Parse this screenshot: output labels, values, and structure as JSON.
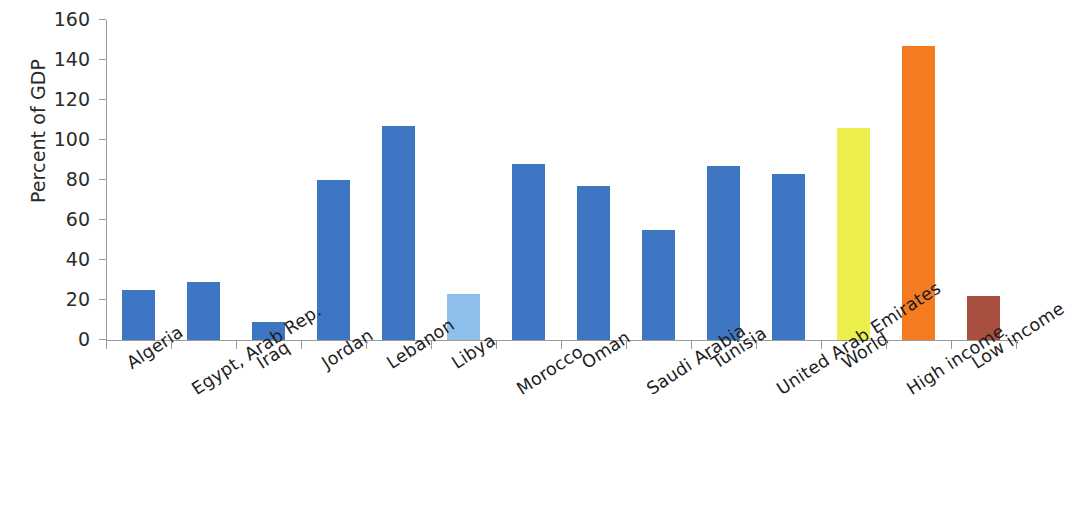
{
  "chart_data": {
    "type": "bar",
    "title": "",
    "subtitle": "",
    "xlabel": "",
    "ylabel": "Percent of GDP",
    "ylim": [
      0,
      160
    ],
    "yticks": [
      0,
      20,
      40,
      60,
      80,
      100,
      120,
      140,
      160
    ],
    "grid": false,
    "legend": "none",
    "categories": [
      "Algeria",
      "Egypt, Arab Rep.",
      "Iraq",
      "Jordan",
      "Lebanon",
      "Libya",
      "Morocco",
      "Oman",
      "Saudi Arabia",
      "Tunisia",
      "United Arab Emirates",
      "World",
      "High income",
      "Low income"
    ],
    "values": [
      25,
      29,
      9,
      80,
      107,
      23,
      88,
      77,
      55,
      87,
      83,
      106,
      147,
      22
    ],
    "bar_colors": [
      "#3E76C4",
      "#3E76C4",
      "#3E76C4",
      "#3E76C4",
      "#3E76C4",
      "#8FC0EC",
      "#3E76C4",
      "#3E76C4",
      "#3E76C4",
      "#3E76C4",
      "#3E76C4",
      "#EDEF4D",
      "#F47B20",
      "#A8503F"
    ],
    "palette": {
      "blue": "#3E76C4",
      "light_blue": "#8FC0EC",
      "yellow": "#EDEF4D",
      "orange": "#F47B20",
      "brown": "#A8503F",
      "axis": "#9a9a9a",
      "text": "#1d1d1d",
      "background": "#ffffff"
    }
  }
}
